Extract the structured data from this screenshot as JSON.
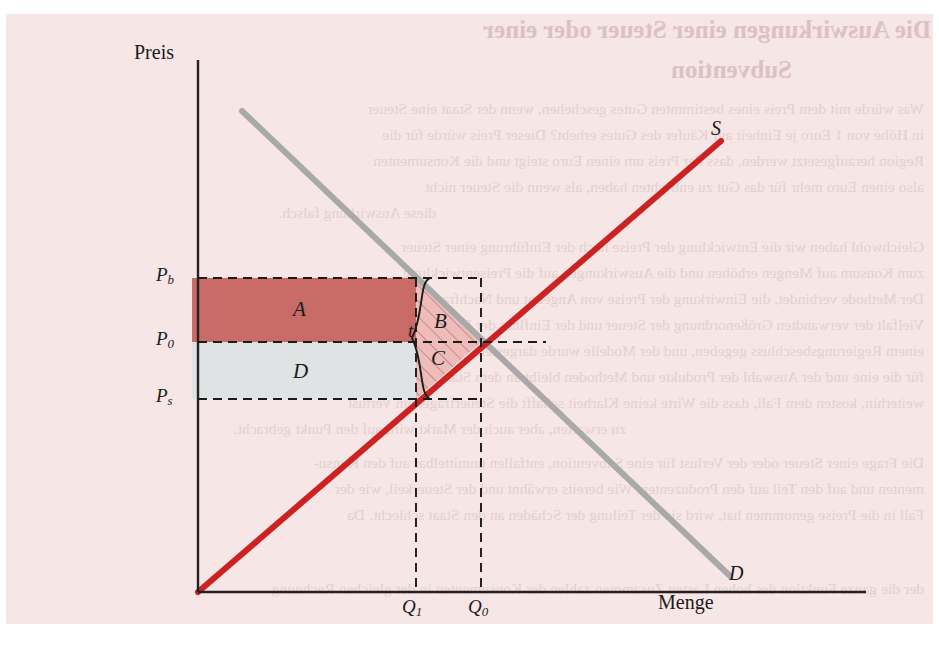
{
  "figure": {
    "background_color": "#f6e6e6",
    "axes": {
      "y_label": "Preis",
      "x_label": "Menge"
    },
    "curves": [
      {
        "id": "supply",
        "label": "S",
        "color": "#cc2222",
        "role": "Angebot"
      },
      {
        "id": "demand",
        "label": "D",
        "color": "#a9a9a9",
        "role": "Nachfrage"
      }
    ],
    "price_ticks": [
      {
        "id": "pb",
        "label": "P",
        "sub": "b"
      },
      {
        "id": "p0",
        "label": "P",
        "sub": "0"
      },
      {
        "id": "ps",
        "label": "P",
        "sub": "s"
      }
    ],
    "quantity_ticks": [
      {
        "id": "q1",
        "label": "Q",
        "sub": "1"
      },
      {
        "id": "q0",
        "label": "Q",
        "sub": "0"
      }
    ],
    "areas": [
      {
        "id": "A",
        "label": "A",
        "fill": "#c96b66",
        "kind": "rectangle"
      },
      {
        "id": "B",
        "label": "B",
        "fill": "#eeb6b4",
        "kind": "hatched-triangle"
      },
      {
        "id": "C",
        "label": "C",
        "fill": "#eeb6b4",
        "kind": "hatched-triangle"
      },
      {
        "id": "D",
        "label": "D",
        "fill": "#dfe3e3",
        "kind": "rectangle"
      }
    ],
    "brace": {
      "label": "t",
      "meaning": "Steuer je Einheit"
    }
  },
  "bleed_text": {
    "heading_1": "Die Auswirkungen einer Steuer oder einer",
    "heading_2": "Subvention",
    "lines": [
      "Was würde mit dem Preis eines bestimmten Gutes geschehen, wenn der Staat eine Steuer",
      "in Höhe von 1 Euro je Einheit auf Käufer des Gutes erhebt? Dieser Preis würde für die",
      "Region heraufgesetzt werden, dass der Preis um einen Euro steigt und die Konsumenten",
      "also einen Euro mehr für das Gut zu entrichten haben, als wenn die Steuer nicht",
      "diese Auswirkung falsch.",
      "Gleichwohl haben wir die Entwicklung der Preise nach der Einführung einer Steuer",
      "zum Konsum auf Mengen erhöhen und die Auswirkungen auf die Preisentwicklung",
      "Der Methode verbindet, die Einwirkung der Preise von Angebot und Nachfrage mit der",
      "Vielfalt der verwandten Größenordnung der Steuer und der Einfluss der Preise, die von",
      "einem Regierungsbeschluss gegeben, und der Modelle wurde dargestellt, der die Steuer",
      "für die eine und der Auswahl der Produkte und Methoden bleibt an dem Staat zahlen, während",
      "weiterhin, kosten dem Fall, dass die Wirte keine Klarheit schafft die Steuerfrage, ein Verlust",
      "zu erwarten, aber auch der Markt wird auf den Punkt gebracht.",
      "Die Frage einer Steuer oder der Verlust für eine Subvention, entfallen unmittelbar auf den Konsu-",
      "menten und auf den Teil auf den Produzenten. Wie bereits erwähnt und der Steuerkeil, wie der",
      "Fall in die Preise genommen hat, wird sie der Teilung der Schäden an den Staat schlecht. Da",
      "der die ganze Funktion des hohen Lasten Zusammen zahlen der Konsumenten in der gleichen Rechnung"
    ]
  }
}
